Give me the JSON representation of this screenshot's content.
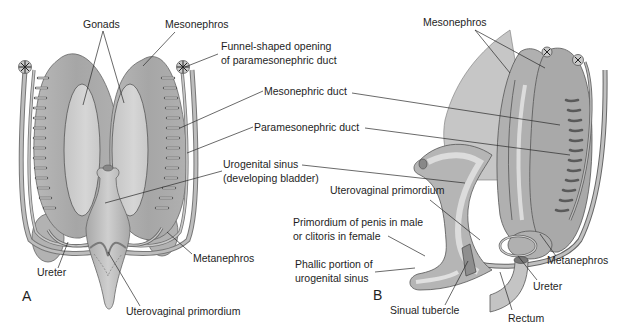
{
  "figure": {
    "panels": [
      {
        "id": "A",
        "label": "A"
      },
      {
        "id": "B",
        "label": "B"
      }
    ],
    "labels": {
      "gonads": "Gonads",
      "mesonephros_a": "Mesonephros",
      "funnel_line1": "Funnel-shaped opening",
      "funnel_line2": "of paramesonephric duct",
      "mesonephric_duct": "Mesonephric duct",
      "paramesonephric_duct": "Paramesonephric duct",
      "urogenital_line1": "Urogenital sinus",
      "urogenital_line2": "(developing bladder)",
      "metanephros_a": "Metanephros",
      "ureter_a": "Ureter",
      "uterovaginal_a": "Uterovaginal primordium",
      "mesonephros_b": "Mesonephros",
      "uterovaginal_b": "Uterovaginal primordium",
      "primordium_line1": "Primordium of penis in male",
      "primordium_line2": "or clitoris in female",
      "phallic_line1": "Phallic portion of",
      "phallic_line2": "urogenital sinus",
      "metanephros_b": "Metanephros",
      "ureter_b": "Ureter",
      "sinual_tubercle": "Sinual tubercle",
      "rectum": "Rectum"
    },
    "colors": {
      "tissue_dark": "#9a9a9a",
      "tissue_mid": "#b4b4b4",
      "tissue_light": "#cfcfcf",
      "outline": "#555555",
      "leader": "#2a2a2a"
    }
  }
}
